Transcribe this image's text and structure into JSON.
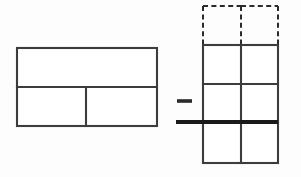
{
  "figure": {
    "background_color": "#fdfdfd",
    "canvas": {
      "width": 301,
      "height": 177
    },
    "operator": {
      "symbol": "minus",
      "label": "−",
      "x1": 177,
      "x2": 192,
      "y": 101,
      "color": "#2a2a2a",
      "stroke_width": 3.6
    }
  },
  "left_shape": {
    "name": "left-rectangle-model",
    "description": "Wide rectangle split by a horizontal line; lower band split by one vertical line",
    "color": "#3c3c3c",
    "stroke_width": 2.1,
    "x": 17,
    "y": 48,
    "width": 140,
    "height": 78,
    "right": 157,
    "bottom": 126,
    "horizontal_divider_y": 87,
    "lower_vertical_divider_x": 86,
    "rows": 2,
    "row_boundaries": [
      48,
      87,
      126
    ],
    "cells": [
      {
        "name": "top-band",
        "x": 17,
        "y": 48,
        "width": 140,
        "height": 39
      },
      {
        "name": "bottom-left-cell",
        "x": 17,
        "y": 87,
        "width": 69,
        "height": 39
      },
      {
        "name": "bottom-right-cell",
        "x": 86,
        "y": 87,
        "width": 71,
        "height": 39
      }
    ]
  },
  "right_shape": {
    "name": "right-grid-model",
    "description": "Two-column grid: one dashed top row above three solid rows, crossed by a thick fraction bar",
    "color": "#3c3c3c",
    "dashed_color": "#2b2b2b",
    "stroke_width": 2.1,
    "x": 203,
    "right": 278,
    "width": 75,
    "center_divider_x": 241,
    "dashed_top_y": 6,
    "solid_top_y": 45,
    "bottom_y": 163,
    "row_boundaries": [
      6,
      45,
      84,
      122,
      163
    ],
    "dashed_rows": 1,
    "solid_rows": 3,
    "columns": 2,
    "cells": [
      {
        "name": "dashed-cell-top-left",
        "x": 203,
        "y": 6,
        "width": 38,
        "height": 39,
        "style": "dashed"
      },
      {
        "name": "dashed-cell-top-right",
        "x": 241,
        "y": 6,
        "width": 37,
        "height": 39,
        "style": "dashed"
      },
      {
        "name": "solid-cell-row1-left",
        "x": 203,
        "y": 45,
        "width": 38,
        "height": 39,
        "style": "solid"
      },
      {
        "name": "solid-cell-row1-right",
        "x": 241,
        "y": 45,
        "width": 37,
        "height": 39,
        "style": "solid"
      },
      {
        "name": "solid-cell-row2-left",
        "x": 203,
        "y": 84,
        "width": 38,
        "height": 38,
        "style": "solid"
      },
      {
        "name": "solid-cell-row2-right",
        "x": 241,
        "y": 84,
        "width": 37,
        "height": 38,
        "style": "solid"
      },
      {
        "name": "solid-cell-row3-left",
        "x": 203,
        "y": 122,
        "width": 38,
        "height": 41,
        "style": "solid"
      },
      {
        "name": "solid-cell-row3-right",
        "x": 241,
        "y": 122,
        "width": 37,
        "height": 41,
        "style": "solid"
      }
    ]
  },
  "fraction_bar": {
    "name": "thick-fraction-bar",
    "x1": 176,
    "x2": 278,
    "y": 122,
    "color": "#1a1a1a",
    "stroke_width": 4.0
  }
}
